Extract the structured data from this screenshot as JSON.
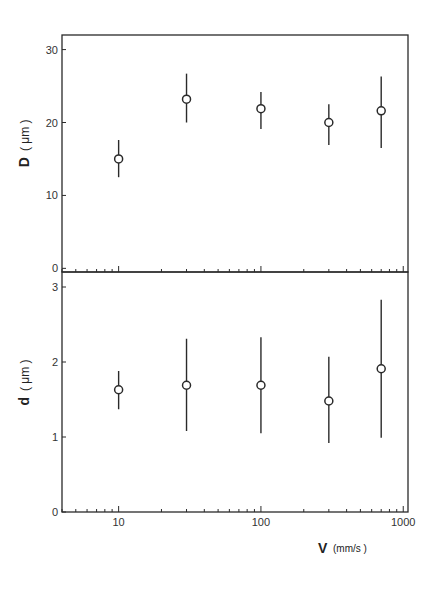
{
  "chart_data": [
    {
      "type": "scatter",
      "panel": "upper",
      "title": "",
      "xlabel": "V (mm/s)",
      "ylabel": "D (μm)",
      "xscale": "log",
      "xlim": [
        4,
        1080
      ],
      "ylim": [
        -0.5,
        32
      ],
      "yticks": [
        0,
        10,
        20,
        30
      ],
      "ytick_labels": [
        "0",
        "10",
        "20",
        "30"
      ],
      "grid": false,
      "marker": "open-circle",
      "series": [
        {
          "name": "D",
          "x": [
            10,
            30,
            100,
            300,
            700
          ],
          "values": [
            15.0,
            23.2,
            21.9,
            20.0,
            21.6
          ],
          "err_low": [
            12.5,
            20.0,
            19.1,
            16.9,
            16.5
          ],
          "err_high": [
            17.6,
            26.7,
            24.2,
            22.5,
            26.3
          ]
        }
      ]
    },
    {
      "type": "scatter",
      "panel": "lower",
      "title": "",
      "xlabel": "V (mm/s)",
      "ylabel": "d (μm)",
      "xscale": "log",
      "xlim": [
        4,
        1080
      ],
      "ylim": [
        0,
        3.2
      ],
      "xticks": [
        10,
        100,
        1000
      ],
      "xtick_labels": [
        "10",
        "100",
        "1000"
      ],
      "yticks": [
        0,
        1,
        2,
        3
      ],
      "ytick_labels": [
        "0",
        "1",
        "2",
        "3"
      ],
      "grid": false,
      "marker": "open-circle",
      "series": [
        {
          "name": "d",
          "x": [
            10,
            30,
            100,
            300,
            700
          ],
          "values": [
            1.63,
            1.69,
            1.69,
            1.48,
            1.91
          ],
          "err_low": [
            1.37,
            1.08,
            1.05,
            0.92,
            0.99
          ],
          "err_high": [
            1.88,
            2.31,
            2.33,
            2.07,
            2.83
          ]
        }
      ]
    }
  ],
  "labels": {
    "upper_ylabel_main": "D",
    "upper_ylabel_unit": "( μm )",
    "lower_ylabel_main": "d",
    "lower_ylabel_unit": "( μm )",
    "xlabel_main": "V",
    "xlabel_unit": "(mm/s )"
  },
  "colors": {
    "ink": "#2a2a2a",
    "background": "#ffffff"
  }
}
